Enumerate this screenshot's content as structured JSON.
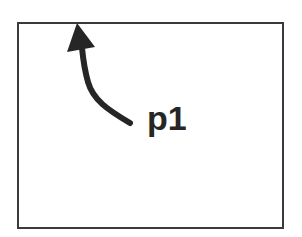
{
  "diagram": {
    "label": "p1",
    "colors": {
      "border": "#3a3a3a",
      "arrow": "#262626",
      "text": "#262626",
      "background": "#ffffff"
    },
    "frame": {
      "x": 17,
      "y": 22,
      "width": 267,
      "height": 207
    },
    "arrow": {
      "points_to": "top edge of frame",
      "tip": [
        77,
        23
      ],
      "tail": [
        130,
        124
      ]
    }
  }
}
